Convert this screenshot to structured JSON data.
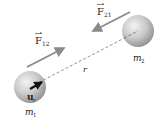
{
  "diagram": {
    "masses": [
      {
        "id": "m1",
        "label": "m",
        "subscript": "1"
      },
      {
        "id": "m2",
        "label": "m",
        "subscript": "2"
      }
    ],
    "forces": [
      {
        "id": "F12",
        "label": "F",
        "subscript": "12",
        "direction": "toward m2"
      },
      {
        "id": "F21",
        "label": "F",
        "subscript": "21",
        "direction": "toward m1"
      }
    ],
    "separation_label": "r",
    "unit_vector": {
      "label": "u",
      "subscript": "r"
    },
    "colors": {
      "arrow": "#8a8a8a",
      "sphere_light": "#f2f2f2",
      "sphere_dark": "#9a9a9a",
      "unit_vector": "#111111",
      "dashed_line": "#777777"
    }
  }
}
